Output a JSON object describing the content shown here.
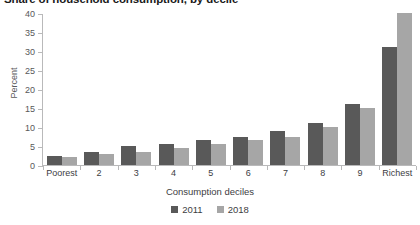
{
  "chart_data": {
    "type": "bar",
    "title": "Share of household consumption, by decile",
    "xlabel": "Consumption deciles",
    "ylabel": "Percent",
    "ylim": [
      0,
      40
    ],
    "yticks": [
      0,
      5,
      10,
      15,
      20,
      25,
      30,
      35,
      40
    ],
    "grid": false,
    "legend_position": "bottom",
    "categories": [
      "Poorest",
      "2",
      "3",
      "4",
      "5",
      "6",
      "7",
      "8",
      "9",
      "Richest"
    ],
    "series": [
      {
        "name": "2011",
        "color": "#595959",
        "values": [
          2.5,
          3.5,
          5.0,
          5.5,
          6.5,
          7.5,
          9.0,
          11.0,
          16.0,
          31.0
        ]
      },
      {
        "name": "2018",
        "color": "#a6a6a6",
        "values": [
          2.0,
          3.0,
          3.5,
          4.5,
          5.5,
          6.5,
          7.5,
          10.0,
          15.0,
          40.0
        ]
      }
    ]
  }
}
